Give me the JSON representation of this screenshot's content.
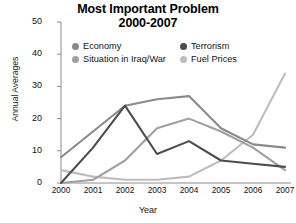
{
  "title": {
    "line1": "Most Important Problem",
    "line2": "2000-2007"
  },
  "axes": {
    "ylabel": "Annual Averages",
    "xlabel": "Year"
  },
  "colors": {
    "economy": "#8a8a8a",
    "terrorism": "#4d4d4d",
    "situation_iraq_war": "#a0a0a0",
    "fuel_prices": "#bdbdbd",
    "axis": "#8c8c8c"
  },
  "legend": [
    {
      "label": "Economy",
      "key": "economy",
      "dot": "#8a8a8a"
    },
    {
      "label": "Terrorism",
      "key": "terrorism",
      "dot": "#4d4d4d"
    },
    {
      "label": "Situation in Iraq/War",
      "key": "situation_iraq_war",
      "dot": "#a0a0a0"
    },
    {
      "label": "Fuel Prices",
      "key": "fuel_prices",
      "dot": "#bdbdbd"
    }
  ],
  "chart_data": {
    "type": "line",
    "title": "Most Important Problem 2000-2007",
    "xlabel": "Year",
    "ylabel": "Annual Averages",
    "categories": [
      "2000",
      "2001",
      "2002",
      "2003",
      "2004",
      "2005",
      "2006",
      "2007"
    ],
    "x": [
      2000,
      2001,
      2002,
      2003,
      2004,
      2005,
      2006,
      2007
    ],
    "ylim": [
      0,
      50
    ],
    "yticks": [
      0,
      10,
      20,
      30,
      40,
      50
    ],
    "grid": false,
    "legend_position": "top-center",
    "series": [
      {
        "name": "Economy",
        "values": [
          8,
          16,
          24,
          26,
          27,
          17,
          12,
          11
        ]
      },
      {
        "name": "Terrorism",
        "values": [
          0,
          11,
          24,
          9,
          13,
          7,
          6,
          5
        ]
      },
      {
        "name": "Situation in Iraq/War",
        "values": [
          0,
          1,
          7,
          17,
          20,
          16,
          11,
          4
        ]
      },
      {
        "name": "Fuel Prices",
        "values": [
          4,
          2,
          1,
          1,
          2,
          7,
          15,
          34
        ]
      }
    ]
  }
}
